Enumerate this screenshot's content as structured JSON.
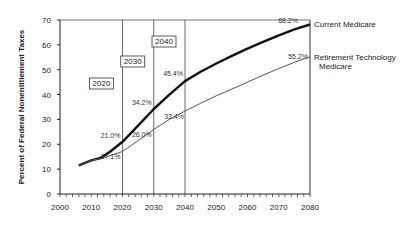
{
  "chart_data": {
    "type": "line",
    "title": "",
    "xlabel": "",
    "ylabel": "Percent of Federal Nonentitlement Taxes",
    "xlim": [
      2000,
      2080
    ],
    "ylim": [
      0,
      70
    ],
    "xticks": [
      2000,
      2010,
      2020,
      2030,
      2040,
      2050,
      2060,
      2070,
      2080
    ],
    "yticks": [
      0,
      10,
      20,
      30,
      40,
      50,
      60,
      70
    ],
    "grid": false,
    "legend_placement": "right (end of lines)",
    "series": [
      {
        "name": "Current Medicare",
        "label_lines": [
          "Current Medicare"
        ],
        "style": "thick",
        "x": [
          2006,
          2010,
          2013,
          2016,
          2020,
          2025,
          2030,
          2035,
          2040,
          2045,
          2050,
          2055,
          2060,
          2065,
          2070,
          2075,
          2080
        ],
        "values": [
          11.5,
          13.5,
          14.5,
          17.0,
          21.0,
          27.5,
          34.2,
          40.0,
          45.4,
          49.2,
          52.5,
          55.6,
          58.5,
          61.2,
          63.8,
          66.2,
          68.2
        ]
      },
      {
        "name": "Retirement Technology Medicare",
        "label_lines": [
          "Retirement Technology",
          "Medicare"
        ],
        "style": "thin",
        "x": [
          2006,
          2010,
          2013,
          2016,
          2020,
          2025,
          2030,
          2035,
          2040,
          2045,
          2050,
          2055,
          2060,
          2065,
          2070,
          2075,
          2080
        ],
        "values": [
          11.5,
          13.5,
          14.3,
          15.4,
          17.1,
          21.5,
          26.0,
          30.0,
          33.4,
          36.5,
          39.5,
          42.2,
          45.0,
          47.8,
          50.5,
          53.0,
          55.2
        ]
      }
    ],
    "annotations": [
      {
        "series": 0,
        "year": 2020,
        "value": 21.0,
        "text": "21.0%"
      },
      {
        "series": 0,
        "year": 2030,
        "value": 34.2,
        "text": "34.2%"
      },
      {
        "series": 0,
        "year": 2040,
        "value": 45.4,
        "text": "45.4%"
      },
      {
        "series": 0,
        "year": 2080,
        "value": 68.2,
        "text": "68.2%"
      },
      {
        "series": 1,
        "year": 2020,
        "value": 17.1,
        "text": "17.1%"
      },
      {
        "series": 1,
        "year": 2030,
        "value": 26.0,
        "text": "26.0%"
      },
      {
        "series": 1,
        "year": 2040,
        "value": 33.4,
        "text": "33.4%"
      },
      {
        "series": 1,
        "year": 2080,
        "value": 55.2,
        "text": "55.2%"
      }
    ],
    "reference_lines": [
      {
        "year": 2020,
        "label": "2020"
      },
      {
        "year": 2030,
        "label": "2030"
      },
      {
        "year": 2040,
        "label": "2040"
      }
    ]
  }
}
